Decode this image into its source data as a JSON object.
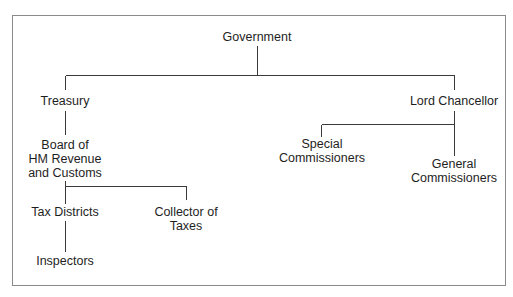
{
  "diagram": {
    "type": "org-chart",
    "line_color": "#3a3a3a",
    "frame_color": "#8a8a8a",
    "nodes": {
      "government": {
        "lines": [
          "Government"
        ]
      },
      "treasury": {
        "lines": [
          "Treasury"
        ]
      },
      "lord_chancellor": {
        "lines": [
          "Lord Chancellor"
        ]
      },
      "board": {
        "lines": [
          "Board of",
          "HM Revenue",
          "and Customs"
        ]
      },
      "special_commissioners": {
        "lines": [
          "Special",
          "Commissioners"
        ]
      },
      "general_commissioners": {
        "lines": [
          "General",
          "Commissioners"
        ]
      },
      "tax_districts": {
        "lines": [
          "Tax Districts"
        ]
      },
      "collector_of_taxes": {
        "lines": [
          "Collector of",
          "Taxes"
        ]
      },
      "inspectors": {
        "lines": [
          "Inspectors"
        ]
      }
    },
    "edges": [
      [
        "Government",
        "Treasury"
      ],
      [
        "Government",
        "Lord Chancellor"
      ],
      [
        "Treasury",
        "Board of HM Revenue and Customs"
      ],
      [
        "Lord Chancellor",
        "Special Commissioners"
      ],
      [
        "Lord Chancellor",
        "General Commissioners"
      ],
      [
        "Board of HM Revenue and Customs",
        "Tax Districts"
      ],
      [
        "Board of HM Revenue and Customs",
        "Collector of Taxes"
      ],
      [
        "Tax Districts",
        "Inspectors"
      ]
    ]
  }
}
